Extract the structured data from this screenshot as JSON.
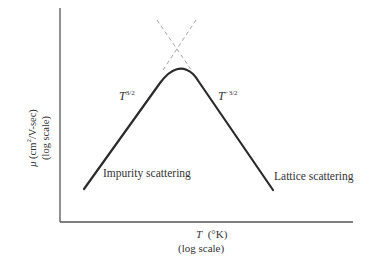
{
  "diagram": {
    "y_axis": {
      "symbol": "μ",
      "unit": "(cm",
      "unit_sup": "2",
      "unit_rest": "/V-sec)",
      "scale": "(log scale)"
    },
    "x_axis": {
      "symbol": "T",
      "unit": "(°K)",
      "scale": "(log scale)"
    },
    "curve_labels": {
      "left_power_base": "T",
      "left_power_exp": "3/2",
      "right_power_base": "T",
      "right_power_exp": "−3/2"
    },
    "region_labels": {
      "left": "Impurity scattering",
      "right": "Lattice scattering"
    },
    "colors": {
      "curve": "#2b2b2b",
      "axis": "#555555",
      "dashed": "#9a9a9a"
    }
  }
}
